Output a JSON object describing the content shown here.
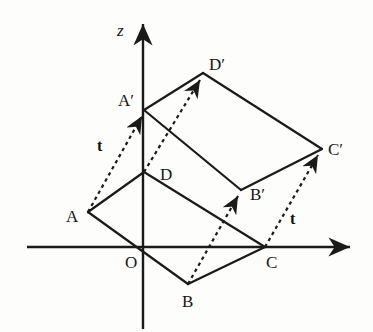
{
  "figure": {
    "background_color": "#fdfdfc",
    "stroke_color": "#1a1a1a",
    "axes": {
      "z_axis": {
        "label": "z",
        "label_pos": [
          118,
          35
        ],
        "x": 143,
        "y_top": 18,
        "y_bottom": 329,
        "arrow": "up"
      },
      "x_axis": {
        "label": "",
        "y": 247,
        "x_left": 27,
        "x_right": 357,
        "arrow": "right"
      },
      "origin": {
        "label": "O",
        "point": [
          143,
          247
        ],
        "label_pos": [
          126,
          268
        ]
      }
    },
    "vertices": [
      {
        "id": "A",
        "label": "A",
        "point": [
          88,
          212
        ],
        "label_pos": [
          66,
          222
        ]
      },
      {
        "id": "B",
        "label": "B",
        "point": [
          188,
          284
        ],
        "label_pos": [
          182,
          307
        ]
      },
      {
        "id": "C",
        "label": "C",
        "point": [
          265,
          247
        ],
        "label_pos": [
          266,
          268
        ]
      },
      {
        "id": "D",
        "label": "D",
        "point": [
          144,
          172
        ],
        "label_pos": [
          160,
          180
        ]
      },
      {
        "id": "A'",
        "label": "A′",
        "point": [
          144,
          110
        ],
        "label_pos": [
          120,
          106
        ]
      },
      {
        "id": "B'",
        "label": "B′",
        "point": [
          241,
          190
        ],
        "label_pos": [
          250,
          200
        ]
      },
      {
        "id": "C'",
        "label": "C′",
        "point": [
          322,
          149
        ],
        "label_pos": [
          328,
          152
        ]
      },
      {
        "id": "D'",
        "label": "D′",
        "point": [
          203,
          73
        ],
        "label_pos": [
          209,
          70
        ]
      }
    ],
    "solid_edges": [
      {
        "name": "edge-A-D",
        "from": [
          88,
          212
        ],
        "to": [
          144,
          172
        ]
      },
      {
        "name": "edge-D-C",
        "from": [
          144,
          172
        ],
        "to": [
          265,
          247
        ]
      },
      {
        "name": "edge-C-B",
        "from": [
          265,
          247
        ],
        "to": [
          188,
          284
        ]
      },
      {
        "name": "edge-B-A",
        "from": [
          188,
          284
        ],
        "to": [
          88,
          212
        ]
      },
      {
        "name": "edge-Ap-Dp",
        "from": [
          144,
          110
        ],
        "to": [
          203,
          73
        ]
      },
      {
        "name": "edge-Dp-Cp",
        "from": [
          203,
          73
        ],
        "to": [
          322,
          149
        ]
      },
      {
        "name": "edge-Cp-Bp",
        "from": [
          322,
          149
        ],
        "to": [
          241,
          190
        ]
      },
      {
        "name": "edge-Bp-Ap",
        "from": [
          241,
          190
        ],
        "to": [
          144,
          110
        ]
      }
    ],
    "translation_arrows": [
      {
        "name": "translation-vector-A-to-Ap",
        "from": [
          88,
          212
        ],
        "to": [
          144,
          112
        ],
        "label": "t",
        "label_pos": [
          98,
          150
        ]
      },
      {
        "name": "translation-vector-B-to-Bp",
        "from": [
          188,
          284
        ],
        "to": [
          240,
          192
        ],
        "label": "",
        "label_pos": [
          0,
          0
        ]
      },
      {
        "name": "translation-vector-C-to-Cp",
        "from": [
          265,
          247
        ],
        "to": [
          320,
          151
        ],
        "label": "t",
        "label_pos": [
          289,
          224
        ]
      },
      {
        "name": "translation-vector-D-to-Dp",
        "from": [
          144,
          172
        ],
        "to": [
          202,
          76
        ],
        "label": "",
        "label_pos": [
          0,
          0
        ]
      }
    ]
  }
}
